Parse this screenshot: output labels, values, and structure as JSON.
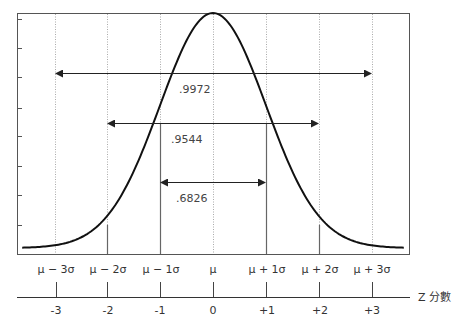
{
  "chart_data": {
    "type": "line",
    "title": "",
    "x": [
      -3.6,
      -3,
      -2,
      -1,
      0,
      1,
      2,
      3,
      3.6
    ],
    "curve": "normal pdf, mean μ, sd σ",
    "sigma_labels": [
      "μ−3σ",
      "μ−2σ",
      "μ−1σ",
      "μ",
      "μ+1σ",
      "μ+2σ",
      "μ+3σ"
    ],
    "z_labels": [
      "-3",
      "-2",
      "-1",
      "0",
      "+1",
      "+2",
      "+3"
    ],
    "xlabel": "Z 分數",
    "ylabel": "",
    "xlim": [
      -3.6,
      3.6
    ],
    "grid": "vertical dotted at integer z",
    "areas": [
      {
        "label": ".6826",
        "from": -1,
        "to": 1
      },
      {
        "label": ".9544",
        "from": -2,
        "to": 2
      },
      {
        "label": ".9972",
        "from": -3,
        "to": 3
      }
    ],
    "legend": "none"
  },
  "labels": {
    "axis_title": "Z 分數",
    "area_1": ".6826",
    "area_2": ".9544",
    "area_3": ".9972",
    "sigma": [
      "μ − 3σ",
      "μ − 2σ",
      "μ − 1σ",
      "μ",
      "μ + 1σ",
      "μ + 2σ",
      "μ + 3σ"
    ],
    "z": [
      "-3",
      "-2",
      "-1",
      "0",
      "+1",
      "+2",
      "+3"
    ]
  },
  "colors": {
    "curve": "#111111",
    "frame": "#555555",
    "grid": "#aaaaaa",
    "arrow": "#222222"
  }
}
